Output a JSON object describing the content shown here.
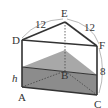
{
  "diagram": {
    "type": "triangular-prism-water-tank",
    "vertices": {
      "A": {
        "label": "A",
        "x": 22,
        "y": 87
      },
      "B": {
        "label": "B",
        "x": 65,
        "y": 71
      },
      "C": {
        "label": "C",
        "x": 97,
        "y": 95
      },
      "D": {
        "label": "D",
        "x": 22,
        "y": 40
      },
      "E": {
        "label": "E",
        "x": 65,
        "y": 22
      },
      "F": {
        "label": "F",
        "x": 97,
        "y": 46
      }
    },
    "dimensions": {
      "DE": "12",
      "EF": "12",
      "FC": "8",
      "water_height": "h"
    },
    "colors": {
      "edge": "#333333",
      "water_top": "#a8a8a8",
      "water_front": "#8c8c8c",
      "arc": "#999999"
    }
  }
}
